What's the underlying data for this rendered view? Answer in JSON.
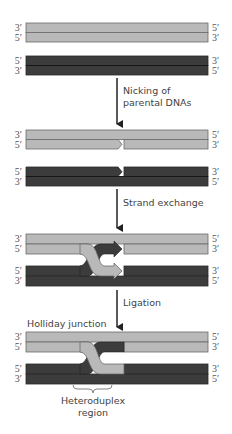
{
  "colors": {
    "light_strand": "#b9b9b9",
    "dark_strand": "#3c3c3c",
    "outline": "#6a6a6a",
    "arrow": "#222222",
    "text": "#444444"
  },
  "stages": [
    {
      "name": "parental-dnas",
      "light_duplex": {
        "left_top": "3′",
        "left_bottom": "5′",
        "right_top": "5′",
        "right_bottom": "3′"
      },
      "dark_duplex": {
        "left_top": "5′",
        "left_bottom": "3′",
        "right_top": "3′",
        "right_bottom": "5′"
      }
    },
    {
      "name": "nicked",
      "light_duplex": {
        "left_top": "3′",
        "left_bottom": "5′",
        "right_top": "5′",
        "right_bottom": "3′"
      },
      "dark_duplex": {
        "left_top": "5′",
        "left_bottom": "3′",
        "right_top": "3′",
        "right_bottom": "5′"
      }
    },
    {
      "name": "strand-exchanged",
      "light_duplex": {
        "left_top": "3′",
        "left_bottom": "5′",
        "right_top": "5′",
        "right_bottom": "3′"
      },
      "dark_duplex": {
        "left_top": "5′",
        "left_bottom": "3′",
        "right_top": "3′",
        "right_bottom": "5′"
      }
    },
    {
      "name": "holliday-junction",
      "light_duplex": {
        "left_top": "3′",
        "left_bottom": "5′",
        "right_top": "5′",
        "right_bottom": "3′"
      },
      "dark_duplex": {
        "left_top": "5′",
        "left_bottom": "3′",
        "right_top": "3′",
        "right_bottom": "5′"
      }
    }
  ],
  "steps": [
    {
      "line1": "Nicking of",
      "line2": "parental DNAs"
    },
    {
      "line1": "Strand exchange"
    },
    {
      "line1": "Ligation"
    }
  ],
  "labels": {
    "holliday_junction": "Holliday junction",
    "heteroduplex_line1": "Heteroduplex",
    "heteroduplex_line2": "region"
  }
}
